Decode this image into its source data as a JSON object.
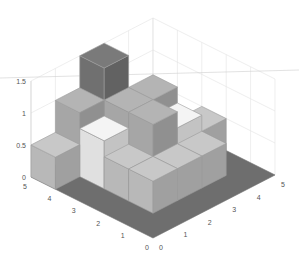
{
  "chart_data": {
    "type": "bar3",
    "title": "",
    "xlabel": "",
    "ylabel": "",
    "zlabel": "",
    "x_ticks": [
      "0",
      "1",
      "2",
      "3",
      "4",
      "5"
    ],
    "y_ticks": [
      "0",
      "1",
      "2",
      "3",
      "4",
      "5"
    ],
    "z_ticks": [
      "0",
      "0.5",
      "1",
      "1.5"
    ],
    "xlim": [
      0,
      5
    ],
    "ylim": [
      0,
      5
    ],
    "zlim": [
      0,
      1.5
    ],
    "grid": true,
    "colormap": "gray",
    "heights": [
      [
        0,
        0,
        0,
        0,
        0
      ],
      [
        0,
        0.5,
        0.5,
        0.5,
        0
      ],
      [
        0,
        0.5,
        1.0,
        0.75,
        0.5
      ],
      [
        0,
        0.75,
        1.0,
        1.0,
        0
      ],
      [
        0.5,
        1.0,
        1.5,
        0,
        0
      ]
    ],
    "row_axis": "left (x)",
    "col_axis": "right (y)"
  },
  "colors": {
    "floor": "#6e6e6e",
    "level_0_5": "#c8c8c8",
    "level_0_75": "#f4f4f4",
    "level_1_0": "#b4b4b4",
    "level_1_5": "#7a7a7a",
    "edge": "#9a9a9a"
  }
}
